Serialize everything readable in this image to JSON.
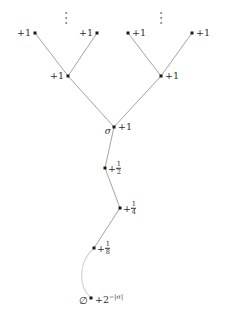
{
  "figure": {
    "kind": "binary-tree-diagram",
    "width": 226,
    "height": 324,
    "background": "#ffffff",
    "edge_color": "#8c8c8c",
    "node_color": "#1a1a1a",
    "text_color": "#2b2b2b"
  },
  "nodes": [
    {
      "id": "leaf1",
      "x": 35,
      "y": 33,
      "label": "+1",
      "side": "left"
    },
    {
      "id": "leaf2",
      "x": 97,
      "y": 33,
      "label": "+1",
      "side": "left"
    },
    {
      "id": "leaf3",
      "x": 128,
      "y": 33,
      "label": "+1",
      "side": "right"
    },
    {
      "id": "leaf4",
      "x": 192,
      "y": 33,
      "label": "+1",
      "side": "right"
    },
    {
      "id": "mid_left",
      "x": 68,
      "y": 76,
      "label": "+1",
      "side": "left"
    },
    {
      "id": "mid_right",
      "x": 161,
      "y": 76,
      "label": "+1",
      "side": "right"
    },
    {
      "id": "sigma",
      "x": 114,
      "y": 127,
      "label": "+1",
      "side": "right",
      "name": "σ"
    },
    {
      "id": "half",
      "x": 105,
      "y": 168,
      "side": "right",
      "frac": {
        "sign": "+",
        "num": "1",
        "den": "2"
      }
    },
    {
      "id": "quarter",
      "x": 120,
      "y": 208,
      "side": "right",
      "frac": {
        "sign": "+",
        "num": "1",
        "den": "4"
      }
    },
    {
      "id": "eighth",
      "x": 94,
      "y": 248,
      "side": "right",
      "frac": {
        "sign": "+",
        "num": "1",
        "den": "8"
      }
    },
    {
      "id": "root",
      "x": 91,
      "y": 298,
      "label": "+2",
      "exponent": "−|σ|",
      "side": "right",
      "name": "∅"
    }
  ],
  "labels": {
    "plus_one": "+1",
    "sigma_symbol": "σ",
    "empty_string_symbol": "∅",
    "root_base": "+2",
    "root_exponent": "−|σ|",
    "frac_half_num": "1",
    "frac_half_den": "2",
    "frac_quarter_num": "1",
    "frac_quarter_den": "4",
    "frac_eighth_num": "1",
    "frac_eighth_den": "8",
    "frac_sign": "+"
  },
  "ellipses": [
    {
      "id": "vdots-left",
      "x": 66,
      "y": 12
    },
    {
      "id": "vdots-right",
      "x": 161,
      "y": 12
    }
  ],
  "edges": [
    {
      "from": "leaf1",
      "to": "mid_left",
      "style": "straight"
    },
    {
      "from": "leaf2",
      "to": "mid_left",
      "style": "straight"
    },
    {
      "from": "leaf3",
      "to": "mid_right",
      "style": "straight"
    },
    {
      "from": "leaf4",
      "to": "mid_right",
      "style": "straight"
    },
    {
      "from": "mid_left",
      "to": "sigma",
      "style": "straight"
    },
    {
      "from": "mid_right",
      "to": "sigma",
      "style": "straight"
    },
    {
      "from": "sigma",
      "to": "half",
      "style": "straight"
    },
    {
      "from": "half",
      "to": "quarter",
      "style": "straight"
    },
    {
      "from": "quarter",
      "to": "eighth",
      "style": "straight"
    },
    {
      "from": "eighth",
      "to": "root",
      "style": "curved"
    }
  ]
}
